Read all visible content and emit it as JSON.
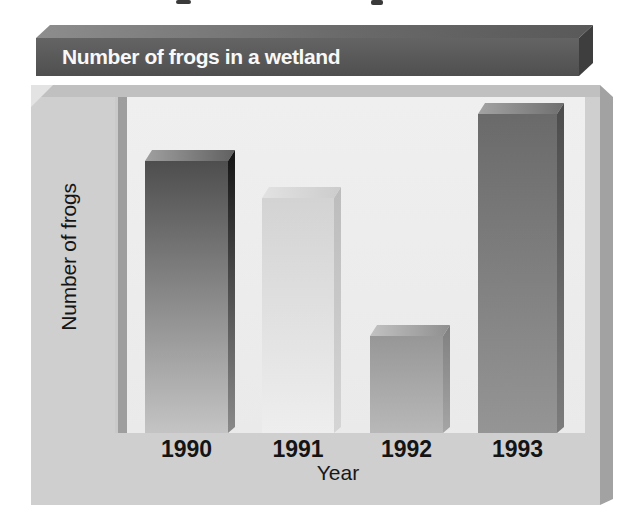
{
  "chart_data": {
    "type": "bar",
    "title": "Number of frogs in a wetland",
    "xlabel": "Year",
    "ylabel": "Number of frogs",
    "categories": [
      "1990",
      "1991",
      "1992",
      "1993"
    ],
    "bar_heights_fraction_of_axis": [
      0.81,
      0.7,
      0.29,
      0.95
    ],
    "value_axis_tick_labels": [],
    "grid": false,
    "legend": false,
    "bar_styles": [
      {
        "front": [
          "#4e4e4e",
          "#c4c4c4"
        ],
        "top": [
          "#a0a0a0",
          "#606060"
        ],
        "side": [
          "#141414",
          "#8a8a8a"
        ]
      },
      {
        "front": [
          "#d3d3d3",
          "#eeeeee"
        ],
        "top": [
          "#e2e2e2",
          "#cccccc"
        ],
        "side": [
          "#bcbcbc",
          "#d5d5d5"
        ]
      },
      {
        "front": [
          "#979797",
          "#b8b8b8"
        ],
        "top": [
          "#c2c2c2",
          "#8f8f8f"
        ],
        "side": [
          "#808080",
          "#a5a5a5"
        ]
      },
      {
        "front": [
          "#6a6a6a",
          "#959595"
        ],
        "top": [
          "#a3a3a3",
          "#6f6f6f"
        ],
        "side": [
          "#4c4c4c",
          "#7c7c7c"
        ]
      }
    ]
  },
  "colors": {
    "title_bar": "#565656",
    "panel": "#cfcfcf",
    "plot_background": "#ececec",
    "axis_line": "#9e9e9e",
    "bottom_band": "#cfcfcf",
    "label_text": "#141414",
    "title_text": "#f8f8f8"
  }
}
